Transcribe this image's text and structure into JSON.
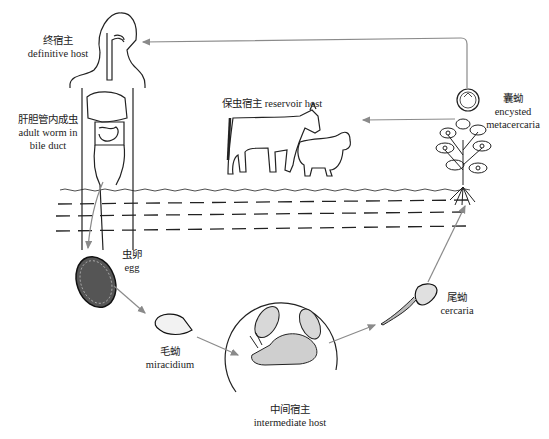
{
  "diagram": {
    "title": "",
    "stages": {
      "definitive_host": {
        "zh": "终宿主",
        "en": "definitive host"
      },
      "adult_worm": {
        "zh": "肝胆管内成虫",
        "en_line1": "adult worm in",
        "en_line2": "bile duct"
      },
      "reservoir_host": {
        "zh": "保虫宿主",
        "en": "reservoir host"
      },
      "metacercaria": {
        "zh": "囊蚴",
        "en_line1": "encysted",
        "en_line2": "metacercaria"
      },
      "egg": {
        "zh": "虫卵",
        "en": "egg"
      },
      "miracidium": {
        "zh": "毛蚴",
        "en": "miracidium"
      },
      "intermediate_host": {
        "zh": "中间宿主",
        "en": "intermediate host"
      },
      "cercaria": {
        "zh": "尾蚴",
        "en": "cercaria"
      }
    },
    "flow": [
      "adult worm in bile duct -> egg",
      "egg -> miracidium",
      "miracidium -> intermediate host",
      "intermediate host -> cercaria",
      "cercaria -> encysted metacercaria",
      "encysted metacercaria -> definitive host",
      "encysted metacercaria -> reservoir host"
    ],
    "colors": {
      "arrow": "#8a8a8a",
      "line": "#222222"
    }
  }
}
